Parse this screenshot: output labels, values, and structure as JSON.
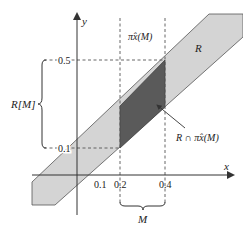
{
  "diagram": {
    "axes": {
      "x_label": "x",
      "y_label": "y"
    },
    "x_ticks": [
      "0.1",
      "0.2",
      "0.4"
    ],
    "y_ticks": [
      "0.5",
      "0.1"
    ],
    "labels": {
      "region_R": "R",
      "projection_top": "π̂x(M)",
      "intersection": "R ∩ π̂x(M)",
      "image_RM": "R[M]",
      "set_M": "M"
    },
    "colors": {
      "band_fill": "#d4d4d4",
      "intersection_fill": "#5a5a5a",
      "axis": "#333333",
      "dashed": "#555555"
    }
  }
}
